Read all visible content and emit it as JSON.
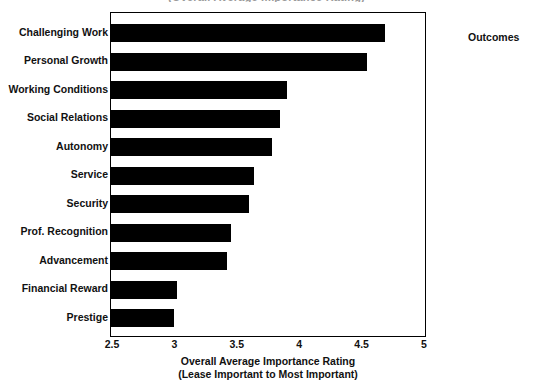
{
  "chart_data": {
    "type": "bar",
    "orientation": "horizontal",
    "title": "(Overall Average Importance Rating)",
    "categories": [
      "Challenging Work",
      "Personal Growth",
      "Working Conditions",
      "Social Relations",
      "Autonomy",
      "Service",
      "Security",
      "Prof. Recognition",
      "Advancement",
      "Financial Reward",
      "Prestige"
    ],
    "values": [
      4.7,
      4.56,
      3.92,
      3.86,
      3.8,
      3.65,
      3.61,
      3.47,
      3.44,
      3.04,
      3.01
    ],
    "xlabel": "Overall Average Importance Rating",
    "xlabel_sub": "(Lease Important to Most Important)",
    "ylabel": "",
    "xlim": [
      2.5,
      5
    ],
    "xticks": [
      "2.5",
      "3",
      "3.5",
      "4",
      "4.5",
      "5"
    ],
    "xtick_values": [
      2.5,
      3,
      3.5,
      4,
      4.5,
      5
    ],
    "grid": false,
    "legend": "Outcomes",
    "legend_position": "right",
    "bar_color": "#000000",
    "background_color": "#ffffff",
    "frame_color": "#000000"
  }
}
